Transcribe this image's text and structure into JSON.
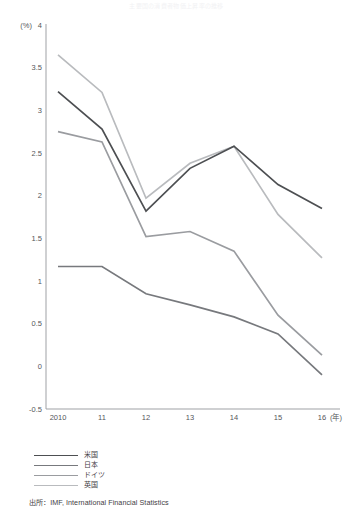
{
  "chart_title": "主要国の消費者物価上昇率の推移",
  "source_note": "出所：IMF, International Financial Statistics",
  "axis": {
    "y_unit_label": "(%)",
    "y_ticks": [
      "4",
      "3.5",
      "3",
      "2.5",
      "2",
      "1.5",
      "1",
      "0.5",
      "0",
      "-0.5"
    ],
    "x_ticks": [
      "2010",
      "11",
      "12",
      "13",
      "14",
      "15",
      "16"
    ],
    "x_unit_label": "(年)"
  },
  "legend": {
    "items": [
      {
        "label": "米国",
        "color": "#4d4f52"
      },
      {
        "label": "日本",
        "color": "#77797d"
      },
      {
        "label": "ドイツ",
        "color": "#9a9ca0"
      },
      {
        "label": "英国",
        "color": "#b9bbbe"
      }
    ]
  },
  "chart_data": {
    "type": "line",
    "title": "主要国の消費者物価上昇率の推移",
    "xlabel": "(年)",
    "ylabel": "(%)",
    "x": [
      "2010",
      "11",
      "12",
      "13",
      "14",
      "15",
      "16"
    ],
    "xlim": [
      2010,
      2016
    ],
    "ylim": [
      -0.5,
      4
    ],
    "ytick_step": 0.5,
    "grid": false,
    "legend_position": "bottom-left",
    "series": [
      {
        "name": "米国",
        "color": "#4d4f52",
        "values": [
          3.22,
          2.78,
          1.82,
          2.32,
          2.58,
          2.13,
          1.85
        ]
      },
      {
        "name": "日本",
        "color": "#77797d",
        "values": [
          1.17,
          1.17,
          0.85,
          0.72,
          0.58,
          0.38,
          -0.1
        ]
      },
      {
        "name": "ドイツ",
        "color": "#9a9ca0",
        "values": [
          2.75,
          2.63,
          1.52,
          1.58,
          1.35,
          0.6,
          0.13
        ]
      },
      {
        "name": "英国",
        "color": "#b9bbbe",
        "values": [
          3.65,
          3.21,
          1.97,
          2.38,
          2.58,
          1.78,
          1.27
        ]
      }
    ]
  }
}
